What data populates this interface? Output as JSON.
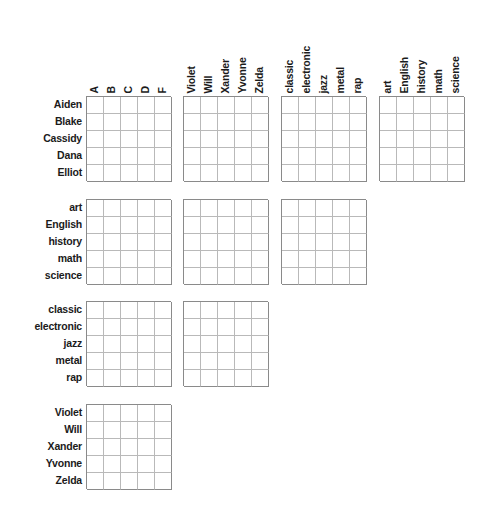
{
  "puzzle": {
    "title": "Logic Puzzle Grid",
    "grid_size": 5,
    "cell_px": 17,
    "categories": [
      {
        "key": "grades",
        "name": "grades",
        "items": [
          "A",
          "B",
          "C",
          "D",
          "F"
        ]
      },
      {
        "key": "names2",
        "name": "second names",
        "items": [
          "Violet",
          "Will",
          "Xander",
          "Yvonne",
          "Zelda"
        ]
      },
      {
        "key": "music",
        "name": "music genres",
        "items": [
          "classic",
          "electronic",
          "jazz",
          "metal",
          "rap"
        ]
      },
      {
        "key": "subjects",
        "name": "school subjects",
        "items": [
          "art",
          "English",
          "history",
          "math",
          "science"
        ]
      },
      {
        "key": "names1",
        "name": "first names",
        "items": [
          "Aiden",
          "Blake",
          "Cassidy",
          "Dana",
          "Elliot"
        ]
      }
    ],
    "column_groups": [
      {
        "id": "col-grades",
        "x": 86,
        "labels": [
          "A",
          "B",
          "C",
          "D",
          "F"
        ]
      },
      {
        "id": "col-names2",
        "x": 183,
        "labels": [
          "Violet",
          "Will",
          "Xander",
          "Yvonne",
          "Zelda"
        ]
      },
      {
        "id": "col-music",
        "x": 281,
        "labels": [
          "classic",
          "electronic",
          "jazz",
          "metal",
          "rap"
        ]
      },
      {
        "id": "col-subjects",
        "x": 379,
        "labels": [
          "art",
          "English",
          "history",
          "math",
          "science"
        ]
      }
    ],
    "row_groups": [
      {
        "id": "row-names1",
        "y": 96,
        "labels": [
          "Aiden",
          "Blake",
          "Cassidy",
          "Dana",
          "Elliot"
        ],
        "blocks": [
          "col-grades",
          "col-names2",
          "col-music",
          "col-subjects"
        ]
      },
      {
        "id": "row-subjects",
        "y": 199,
        "labels": [
          "art",
          "English",
          "history",
          "math",
          "science"
        ],
        "blocks": [
          "col-grades",
          "col-names2",
          "col-music"
        ]
      },
      {
        "id": "row-music",
        "y": 301,
        "labels": [
          "classic",
          "electronic",
          "jazz",
          "metal",
          "rap"
        ],
        "blocks": [
          "col-grades",
          "col-names2"
        ]
      },
      {
        "id": "row-names2",
        "y": 404,
        "labels": [
          "Violet",
          "Will",
          "Xander",
          "Yvonne",
          "Zelda"
        ],
        "blocks": [
          "col-grades"
        ]
      }
    ],
    "colors": {
      "background": "#ffffff",
      "text": "#1b1b1b",
      "grid_outer": "#8a8a8a",
      "grid_inner": "#b9b9b9"
    }
  }
}
